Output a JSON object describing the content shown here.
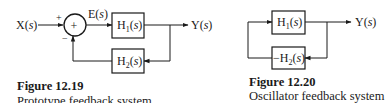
{
  "figure_19": {
    "input_label": "X(s)",
    "error_label": "E(s)",
    "output_label": "Y(s)",
    "sum_symbol": "+",
    "plus_sign": "+",
    "minus_sign": "−",
    "forward_block": {
      "main": "H",
      "sub": "1",
      "arg": "(s)"
    },
    "feedback_block": {
      "main": "H",
      "sub": "2",
      "arg": "(s)"
    },
    "caption_title": "Figure 12.19",
    "caption_subtitle": "Prototype feedback system"
  },
  "figure_20": {
    "output_label": "Y(s)",
    "forward_block": {
      "main": "H",
      "sub": "1",
      "arg": "(s)"
    },
    "feedback_block": {
      "prefix": "−",
      "main": "H",
      "sub": "2",
      "arg": "(s)"
    },
    "caption_title": "Figure 12.20",
    "caption_subtitle": "Oscillator feedback system"
  }
}
